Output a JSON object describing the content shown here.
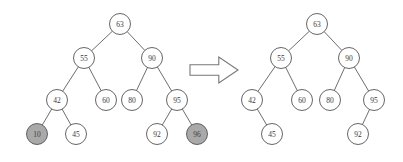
{
  "figure": {
    "node_radius": 10.5,
    "colors": {
      "node_fill": "#ffffff",
      "node_highlight_fill": "#a9a9a9",
      "node_stroke": "#555555",
      "edge_stroke": "#5c5c5c",
      "label_text": "#3a3a3a",
      "arrow_fill": "#ffffff",
      "arrow_stroke": "#777777",
      "background": "#ffffff"
    },
    "transition_arrow": {
      "icon": "right-arrow-icon",
      "direction": "right",
      "x": 190,
      "y": 57,
      "width": 48,
      "height": 26
    }
  },
  "left_tree": {
    "name": "before-tree",
    "caption": "",
    "nodes": [
      {
        "id": "L63",
        "label": "63",
        "x": 120,
        "y": 24,
        "shaded": false
      },
      {
        "id": "L55",
        "label": "55",
        "x": 84,
        "y": 58,
        "shaded": false
      },
      {
        "id": "L90",
        "label": "90",
        "x": 152,
        "y": 58,
        "shaded": false
      },
      {
        "id": "L42",
        "label": "42",
        "x": 57,
        "y": 100,
        "shaded": false
      },
      {
        "id": "L60",
        "label": "60",
        "x": 106,
        "y": 100,
        "shaded": false
      },
      {
        "id": "L80",
        "label": "80",
        "x": 132,
        "y": 100,
        "shaded": false
      },
      {
        "id": "L95",
        "label": "95",
        "x": 177,
        "y": 100,
        "shaded": false
      },
      {
        "id": "L10",
        "label": "10",
        "x": 37,
        "y": 134,
        "shaded": true
      },
      {
        "id": "L45",
        "label": "45",
        "x": 76,
        "y": 134,
        "shaded": false
      },
      {
        "id": "L92",
        "label": "92",
        "x": 157,
        "y": 134,
        "shaded": false
      },
      {
        "id": "L96",
        "label": "96",
        "x": 197,
        "y": 134,
        "shaded": true
      }
    ],
    "edges": [
      {
        "from": "L63",
        "to": "L55"
      },
      {
        "from": "L63",
        "to": "L90"
      },
      {
        "from": "L55",
        "to": "L42"
      },
      {
        "from": "L55",
        "to": "L60"
      },
      {
        "from": "L90",
        "to": "L80"
      },
      {
        "from": "L90",
        "to": "L95"
      },
      {
        "from": "L42",
        "to": "L10"
      },
      {
        "from": "L42",
        "to": "L45"
      },
      {
        "from": "L95",
        "to": "L92"
      },
      {
        "from": "L95",
        "to": "L96"
      }
    ]
  },
  "right_tree": {
    "name": "after-tree",
    "caption": "",
    "nodes": [
      {
        "id": "R63",
        "label": "63",
        "x": 317,
        "y": 24,
        "shaded": false
      },
      {
        "id": "R55",
        "label": "55",
        "x": 281,
        "y": 58,
        "shaded": false
      },
      {
        "id": "R90",
        "label": "90",
        "x": 349,
        "y": 58,
        "shaded": false
      },
      {
        "id": "R42",
        "label": "42",
        "x": 252,
        "y": 100,
        "shaded": false
      },
      {
        "id": "R60",
        "label": "60",
        "x": 302,
        "y": 100,
        "shaded": false
      },
      {
        "id": "R80",
        "label": "80",
        "x": 330,
        "y": 100,
        "shaded": false
      },
      {
        "id": "R95",
        "label": "95",
        "x": 374,
        "y": 100,
        "shaded": false
      },
      {
        "id": "R45",
        "label": "45",
        "x": 272,
        "y": 134,
        "shaded": false
      },
      {
        "id": "R92",
        "label": "92",
        "x": 358,
        "y": 134,
        "shaded": false
      }
    ],
    "edges": [
      {
        "from": "R63",
        "to": "R55"
      },
      {
        "from": "R63",
        "to": "R90"
      },
      {
        "from": "R55",
        "to": "R42"
      },
      {
        "from": "R55",
        "to": "R60"
      },
      {
        "from": "R90",
        "to": "R80"
      },
      {
        "from": "R90",
        "to": "R95"
      },
      {
        "from": "R42",
        "to": "R45"
      },
      {
        "from": "R95",
        "to": "R92"
      }
    ]
  }
}
